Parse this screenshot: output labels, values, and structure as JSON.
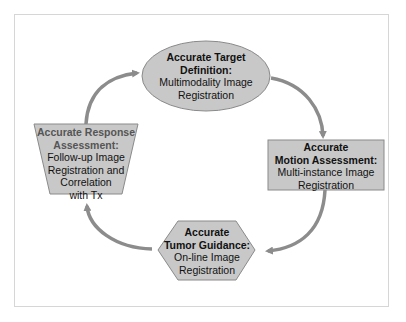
{
  "diagram": {
    "colors": {
      "shape_fill": "#c8c8c8",
      "shape_stroke": "#8a8a8a",
      "arrow": "#8c8c8c",
      "frame": "#d6d6d6"
    },
    "nodes": {
      "target": {
        "shape": "ellipse",
        "title1": "Accurate Target",
        "title2": "Definition:",
        "body1": "Multimodality Image",
        "body2": "Registration"
      },
      "motion": {
        "shape": "rectangle",
        "title1": "Accurate",
        "title2": "Motion Assessment:",
        "body1": "Multi-instance Image",
        "body2": "Registration"
      },
      "guidance": {
        "shape": "hexagon",
        "title1": "Accurate",
        "title2": "Tumor Guidance:",
        "body1": "On-line Image",
        "body2": "Registration"
      },
      "response": {
        "shape": "trapezoid",
        "title1": "Accurate Response",
        "title2": "Assessment:",
        "body1": "Follow-up Image",
        "body2": "Registration and",
        "body3": "Correlation",
        "body4": "with Tx"
      }
    },
    "edges": [
      {
        "from": "response",
        "to": "target"
      },
      {
        "from": "target",
        "to": "motion"
      },
      {
        "from": "motion",
        "to": "guidance"
      },
      {
        "from": "guidance",
        "to": "response"
      }
    ]
  }
}
